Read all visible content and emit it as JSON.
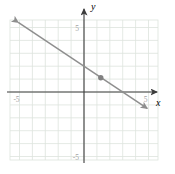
{
  "figure": {
    "background_color": "#ffffff",
    "grid_color": "#dde3dd",
    "axis_color": "#3c3c3c",
    "line_color": "#8e8e8e",
    "point_color": "#818181",
    "tick_label_color": "#a3a3a3",
    "axis_letter_color": "#222222"
  },
  "chart_data": {
    "type": "line",
    "title": "",
    "xlabel": "x",
    "ylabel": "y",
    "xlim": [
      -5.7,
      5.7
    ],
    "ylim": [
      -5.4,
      5.6
    ],
    "grid": true,
    "grid_step": 1,
    "x_tick_labels": [
      {
        "value": -5,
        "label": "-5"
      },
      {
        "value": 5,
        "label": "5"
      }
    ],
    "y_tick_labels": [
      {
        "value": 5,
        "label": "5"
      },
      {
        "value": -5,
        "label": "-5"
      }
    ],
    "series": [
      {
        "name": "plotted-line",
        "slope": -0.6667,
        "y_intercept": 2,
        "x_intercept": 3,
        "draw_from_x": -5.1,
        "draw_to_x": 4.9,
        "arrows": "both"
      }
    ],
    "points": [
      {
        "x": 1.3,
        "y": 1.1
      }
    ]
  }
}
